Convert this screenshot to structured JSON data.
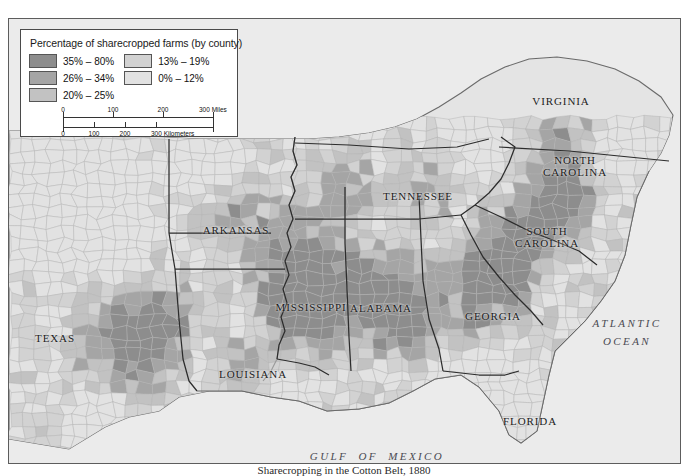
{
  "legend": {
    "title": "Percentage of sharecropped farms (by county)",
    "classes": [
      {
        "label": "35% – 80%",
        "color": "#8d8d8d"
      },
      {
        "label": "26% – 34%",
        "color": "#a5a5a5"
      },
      {
        "label": "20% – 25%",
        "color": "#c2c2c2"
      },
      {
        "label": "13% – 19%",
        "color": "#d2d2d2"
      },
      {
        "label": "0% – 12%",
        "color": "#e2e2e2"
      }
    ],
    "scale_miles": {
      "unit": "300 Miles",
      "ticks": [
        "0",
        "100",
        "200",
        "300"
      ]
    },
    "scale_km": {
      "unit": "300 Kilometers",
      "ticks": [
        "0",
        "100",
        "200",
        "300"
      ]
    }
  },
  "map": {
    "background_color": "#ebebeb",
    "border_color": "#5d5d5d",
    "state_labels": [
      {
        "name": "TEXAS",
        "text": "TEXAS",
        "x": 46,
        "y": 319
      },
      {
        "name": "ARKANSAS",
        "text": "ARKANSAS",
        "x": 227,
        "y": 211
      },
      {
        "name": "LOUISIANA",
        "text": "LOUISIANA",
        "x": 244,
        "y": 355
      },
      {
        "name": "MISSISSIPPI",
        "text": "MISSISSIPPI",
        "x": 302,
        "y": 288
      },
      {
        "name": "ALABAMA",
        "text": "ALABAMA",
        "x": 372,
        "y": 289
      },
      {
        "name": "TENNESSEE",
        "text": "TENNESSEE",
        "x": 409,
        "y": 177
      },
      {
        "name": "GEORGIA",
        "text": "GEORGIA",
        "x": 484,
        "y": 297
      },
      {
        "name": "FLORIDA",
        "text": "FLORIDA",
        "x": 521,
        "y": 402
      },
      {
        "name": "SOUTH CAROLINA",
        "text": "SOUTH\nCAROLINA",
        "x": 538,
        "y": 218
      },
      {
        "name": "NORTH CAROLINA",
        "text": "NORTH\nCAROLINA",
        "x": 566,
        "y": 147
      },
      {
        "name": "VIRGINIA",
        "text": "VIRGINIA",
        "x": 552,
        "y": 82
      }
    ],
    "water_labels": [
      {
        "name": "ATLANTIC OCEAN",
        "text": "ATLANTIC\nOCEAN",
        "x": 618,
        "y": 313
      },
      {
        "name": "GULF OF MEXICO",
        "text": "GULF  OF  MEXICO",
        "x": 368,
        "y": 437
      }
    ]
  },
  "caption": {
    "text": "Sharecropping in the Cotton Belt, 1880"
  }
}
